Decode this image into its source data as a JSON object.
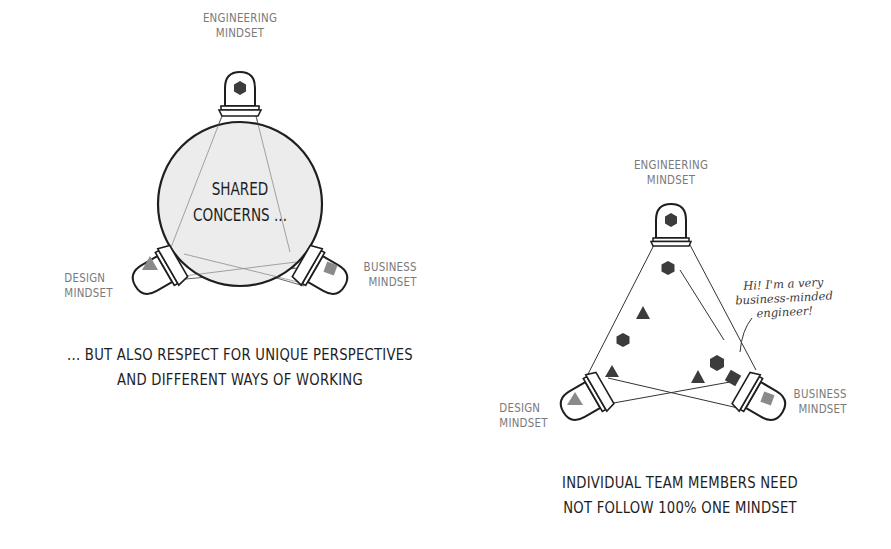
{
  "left_diagram": {
    "labels": {
      "engineering": [
        "ENGINEERING",
        "MINDSET"
      ],
      "design": [
        "DESIGN",
        "MINDSET"
      ],
      "business": [
        "BUSINESS",
        "MINDSET"
      ]
    },
    "center_text": [
      "SHARED",
      "CONCERNS ..."
    ],
    "caption": [
      "... BUT ALSO RESPECT FOR UNIQUE PERSPECTIVES",
      "AND DIFFERENT WAYS OF WORKING"
    ],
    "bulb_icons": {
      "engineering": "hexagon",
      "design": "triangle",
      "business": "square"
    }
  },
  "right_diagram": {
    "labels": {
      "engineering": [
        "ENGINEERING",
        "MINDSET"
      ],
      "design": [
        "DESIGN",
        "MINDSET"
      ],
      "business": [
        "BUSINESS",
        "MINDSET"
      ]
    },
    "speech_note": [
      "Hi! I'm a very",
      "business-minded",
      "engineer!"
    ],
    "caption": [
      "INDIVIDUAL TEAM MEMBERS NEED",
      "NOT FOLLOW 100% ONE MINDSET"
    ],
    "team_members": [
      "hexagon",
      "triangle",
      "hexagon",
      "triangle",
      "hexagon",
      "triangle",
      "square"
    ]
  },
  "colors": {
    "ink": "#1e1e1e",
    "label_gray": "#7a7a7a",
    "shape_dark": "#3c3c3c",
    "shape_light": "#8a8a8a",
    "circle_fill": "#ececec"
  }
}
